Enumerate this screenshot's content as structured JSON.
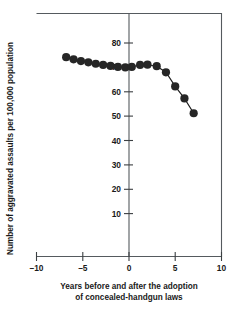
{
  "chart_data": {
    "type": "scatter",
    "title": "",
    "xlabel": "Years before and after the adoption of concealed-handgun laws",
    "xlabel_line1": "Years before and after the adoption",
    "xlabel_line2": "of concealed-handgun laws",
    "ylabel": "Number of aggravated assaults per 100,000 population",
    "xlim": [
      -10,
      10
    ],
    "ylim": [
      0,
      85
    ],
    "xticks": [
      -10,
      -5,
      0,
      5,
      10
    ],
    "xticklabels": [
      "–10",
      "–5",
      "0",
      "5",
      "10"
    ],
    "yticks": [
      10,
      20,
      30,
      40,
      50,
      60,
      70,
      80
    ],
    "yticklabels": [
      "10",
      "20",
      "30",
      "40",
      "50",
      "60",
      "70",
      "80"
    ],
    "grid": false,
    "legend": false,
    "reference_line_x": 0,
    "marker": "filled-circle",
    "connected": true,
    "x": [
      -6.8,
      -6.0,
      -5.2,
      -4.4,
      -3.6,
      -2.8,
      -2.0,
      -1.2,
      -0.4,
      0.3,
      1.2,
      2.0,
      3.0,
      4.0,
      5.0,
      6.0,
      7.0
    ],
    "values": [
      74.2,
      73.3,
      72.6,
      72.1,
      71.5,
      71.0,
      70.6,
      70.2,
      70.0,
      70.2,
      71.0,
      71.1,
      70.5,
      68.0,
      62.2,
      57.3,
      51.2
    ],
    "series": [
      {
        "name": "Aggravated assault rate",
        "x": [
          -6.8,
          -6.0,
          -5.2,
          -4.4,
          -3.6,
          -2.8,
          -2.0,
          -1.2,
          -0.4,
          0.3,
          1.2,
          2.0,
          3.0,
          4.0,
          5.0,
          6.0,
          7.0
        ],
        "values": [
          74.2,
          73.3,
          72.6,
          72.1,
          71.5,
          71.0,
          70.6,
          70.2,
          70.0,
          70.2,
          71.0,
          71.1,
          70.5,
          68.0,
          62.2,
          57.3,
          51.2
        ]
      }
    ],
    "colors": {
      "marker": "#262626",
      "line": "#1c1c1c",
      "frame": "#555a5e",
      "text": "#1a1a1a",
      "background": "#ffffff"
    }
  }
}
